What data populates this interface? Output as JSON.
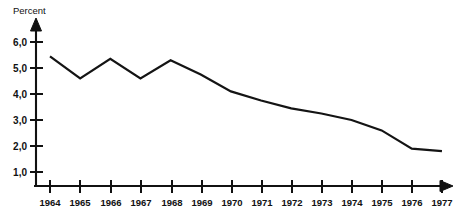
{
  "chart_data": {
    "type": "line",
    "title": "",
    "ylabel": "Percent",
    "xlabel": "",
    "categories": [
      "1964",
      "1965",
      "1966",
      "1967",
      "1968",
      "1969",
      "1970",
      "1971",
      "1972",
      "1973",
      "1974",
      "1975",
      "1976",
      "1977"
    ],
    "x": [
      1964,
      1965,
      1966,
      1967,
      1968,
      1969,
      1970,
      1971,
      1972,
      1973,
      1974,
      1975,
      1976,
      1977
    ],
    "values": [
      5.45,
      4.6,
      5.35,
      4.6,
      5.3,
      4.75,
      4.1,
      3.75,
      3.45,
      3.25,
      3.0,
      2.6,
      1.9,
      1.8
    ],
    "ytick_labels": [
      "6,0",
      "5,0",
      "4,0",
      "3,0",
      "2,0",
      "1,0"
    ],
    "ytick_values": [
      6.0,
      5.0,
      4.0,
      3.0,
      2.0,
      1.0
    ],
    "ylim": [
      0.45,
      6.55
    ],
    "xlim": [
      1963.55,
      1977.75
    ],
    "grid": false,
    "legend": null,
    "decimal_separator": ","
  },
  "axes": {
    "y_axis_title": "Percent",
    "x_axis_arrow": "right-arrow",
    "y_axis_arrow": "up-arrow"
  }
}
